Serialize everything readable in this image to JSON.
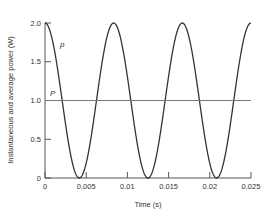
{
  "chart_data": {
    "type": "line",
    "title": "",
    "xlabel": "Time (s)",
    "ylabel": "Instantaneous and average power (W)",
    "xlim": [
      0,
      0.025
    ],
    "ylim": [
      0,
      2.0
    ],
    "grid": false,
    "x_ticks": [
      "0",
      "0.005",
      "0.01",
      "0.015",
      "0.02",
      "0.025"
    ],
    "y_ticks": [
      "0",
      "0.5",
      "1.0",
      "1.5",
      "2.0"
    ],
    "series": [
      {
        "name": "p",
        "description": "Instantaneous power, p(t) = 1 + cos(2π·120·t)",
        "x": [
          0,
          0.00208,
          0.00417,
          0.00625,
          0.00833,
          0.01042,
          0.0125,
          0.01458,
          0.01667,
          0.01875,
          0.02083,
          0.02292,
          0.025
        ],
        "values": [
          2.0,
          1.0,
          0.0,
          1.0,
          2.0,
          1.0,
          0.0,
          1.0,
          2.0,
          1.0,
          0.0,
          1.0,
          2.0
        ]
      },
      {
        "name": "P",
        "description": "Average power",
        "x": [
          0,
          0.025
        ],
        "values": [
          1.0,
          1.0
        ]
      }
    ],
    "annotations": [
      {
        "text": "p",
        "near": "instantaneous curve at t≈0.0015, y≈1.7"
      },
      {
        "text": "P",
        "near": "average line at t≈0.001, y≈1.05"
      }
    ]
  },
  "labels": {
    "xlabel": "Time (s)",
    "ylabel": "Instantaneous and average power (W)",
    "p_label": "p",
    "P_label": "P"
  }
}
